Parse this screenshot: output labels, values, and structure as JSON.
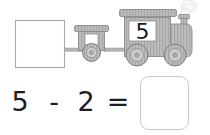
{
  "worksheet": {
    "background_color": "#ffffff",
    "ink_color": "#1e1e1e",
    "outline_color": "#c9c9c9"
  },
  "train": {
    "label": "train illustration",
    "cars": [
      {
        "name": "empty-boxcar",
        "type": "square-box",
        "filled": false,
        "value": ""
      },
      {
        "name": "small-wagon",
        "type": "wagon",
        "wheels": 1,
        "value": ""
      },
      {
        "name": "locomotive",
        "type": "engine",
        "wheels": 2,
        "window_value": "5",
        "has_smoke": true
      }
    ],
    "body_fill": "#b8b8b8",
    "body_stroke": "#8a8a8a",
    "window_fill": "#ffffff",
    "smoke_fill": "#f2f2f2"
  },
  "equation": {
    "left_number": "5",
    "operator": "-",
    "right_number": "2",
    "equals": "=",
    "answer": "",
    "answer_placeholder": ""
  }
}
